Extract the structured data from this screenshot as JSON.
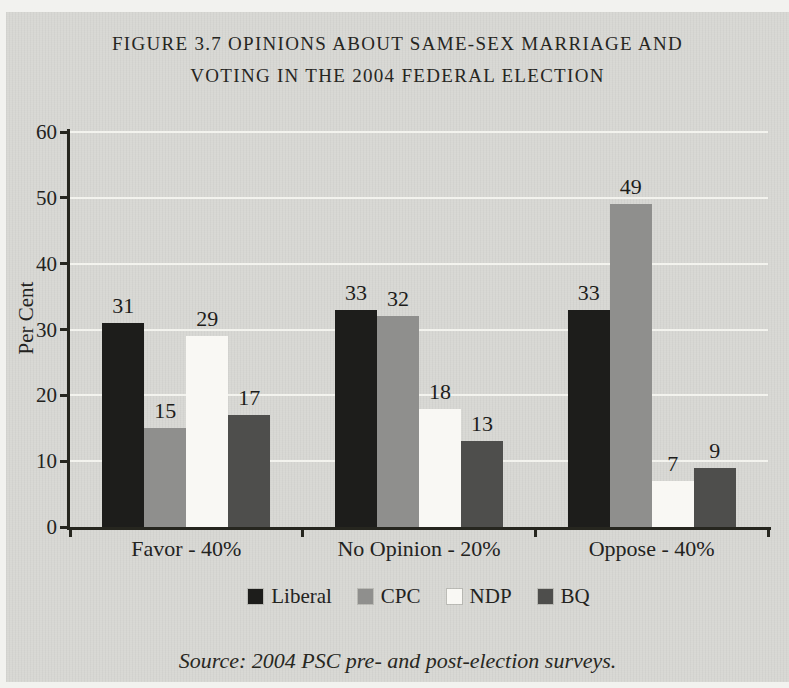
{
  "figure": {
    "title_lines": [
      "FIGURE 3.7 OPINIONS ABOUT SAME-SEX MARRIAGE AND",
      "VOTING IN THE 2004 FEDERAL ELECTION"
    ],
    "source_note": "Source: 2004 PSC pre- and post-election surveys."
  },
  "chart_data": {
    "type": "bar",
    "title": "FIGURE 3.7 OPINIONS ABOUT SAME-SEX MARRIAGE AND VOTING IN THE 2004 FEDERAL ELECTION",
    "categories": [
      "Favor - 40%",
      "No Opinion - 20%",
      "Oppose - 40%"
    ],
    "series": [
      {
        "name": "Liberal",
        "color": "#1d1d1b",
        "values": [
          31,
          33,
          33
        ]
      },
      {
        "name": "CPC",
        "color": "#8f8f8d",
        "values": [
          15,
          32,
          49
        ]
      },
      {
        "name": "NDP",
        "color": "#f9f8f4",
        "values": [
          29,
          18,
          7
        ]
      },
      {
        "name": "BQ",
        "color": "#4e4e4c",
        "values": [
          17,
          13,
          9
        ]
      }
    ],
    "xlabel": "",
    "ylabel": "Per Cent",
    "ylim": [
      0,
      60
    ],
    "yticks": [
      0,
      10,
      20,
      30,
      40,
      50,
      60
    ],
    "grid": true,
    "gridline_color": "#f3f3ee",
    "axis_color": "#26261f",
    "legend_position": "bottom",
    "bar_value_labels": true,
    "panel_background": "#d7d7d3",
    "page_background": "#f2f2ef"
  }
}
